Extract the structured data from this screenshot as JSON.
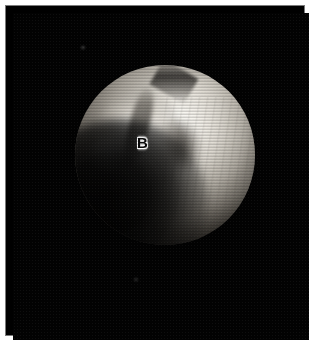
{
  "figure": {
    "kind": "arthroscopic-photograph",
    "panel_label": "B",
    "caption": "",
    "background_color": "#000000",
    "border_color": "#7a7a7a",
    "page_color": "#ffffff",
    "label_color": "#0b0b0b",
    "label_halo_color": "#ffffff"
  },
  "scope_view": {
    "shape": "circle",
    "center_x": 152,
    "center_y": 142,
    "radius": 90,
    "rim_color": "#000000"
  },
  "regions": [
    {
      "name": "bright-cartilage-ridge",
      "description": "Bright white cartilage ridge with flap, upper-left of field",
      "tone": "highlight"
    },
    {
      "name": "ridge-lobe",
      "description": "Secondary bright lobe below the ridge on the left",
      "tone": "highlight"
    },
    {
      "name": "fissure-groove",
      "description": "Dark linear groove running down-right from the ridge",
      "tone": "shadow"
    },
    {
      "name": "notch-shadow",
      "description": "Dark oval notch shadow in the centre-right of the field",
      "tone": "shadow"
    },
    {
      "name": "top-crease",
      "description": "Thin dark crease along the upper rim",
      "tone": "shadow"
    },
    {
      "name": "condyle-surface",
      "description": "Broad smooth bright condylar surface filling the right half",
      "tone": "midtone"
    },
    {
      "name": "lower-shadow",
      "description": "Large black shadow sweeping across the lower-left quadrant",
      "tone": "shadow"
    }
  ],
  "artifacts": {
    "scanlines": "horizontal analog video scanlines",
    "specks": [
      {
        "name": "speck-upper-left"
      },
      {
        "name": "speck-lower-centre"
      }
    ]
  }
}
